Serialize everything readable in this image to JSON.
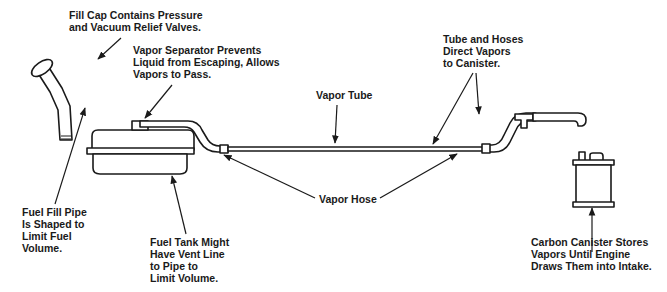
{
  "diagram": {
    "colors": {
      "line": "#1a1a1a",
      "background": "#ffffff"
    },
    "labels": {
      "fill_cap": "Fill Cap Contains Pressure\nand Vacuum Relief Valves.",
      "vapor_separator": "Vapor Separator Prevents\nLiquid from Escaping, Allows\nVapors to Pass.",
      "vapor_tube": "Vapor Tube",
      "tube_and_hoses": "Tube and Hoses\nDirect Vapors\nto Canister.",
      "vapor_hose": "Vapor Hose",
      "fuel_fill_pipe": "Fuel Fill Pipe\nIs Shaped to\nLimit Fuel\nVolume.",
      "fuel_tank": "Fuel Tank Might\nHave Vent Line\nto Pipe to\nLimit Volume.",
      "carbon_canister": "Carbon Canister Stores\nVapors Until Engine\nDraws Them into Intake."
    },
    "components": [
      "fill-cap",
      "fuel-fill-pipe",
      "fuel-tank",
      "vapor-separator",
      "vapor-hose",
      "vapor-tube",
      "t-fitting",
      "canister-hose",
      "carbon-canister"
    ]
  }
}
